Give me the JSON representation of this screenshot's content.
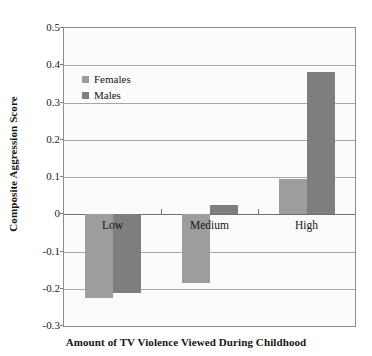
{
  "chart_data": {
    "type": "bar",
    "title": "",
    "xlabel": "Amount of TV Violence Viewed During Childhood",
    "ylabel": "Composite Aggression Score",
    "categories": [
      "Low",
      "Medium",
      "High"
    ],
    "series": [
      {
        "name": "Females",
        "color": "#9d9d9d",
        "values": [
          -0.225,
          -0.185,
          0.095
        ]
      },
      {
        "name": "Males",
        "color": "#7e7e7e",
        "values": [
          -0.212,
          0.025,
          0.383
        ]
      }
    ],
    "ylim": [
      -0.3,
      0.5
    ],
    "yticks": [
      0.5,
      0.4,
      0.3,
      0.2,
      0.1,
      0,
      -0.1,
      -0.2,
      -0.3
    ],
    "ytick_labels": [
      "0.5",
      "0.4",
      "0.3",
      "0.2",
      "0.1",
      "0",
      "-0.1",
      "-0.2",
      "-0.3"
    ],
    "grid": true,
    "legend_position": "top-left-inside",
    "legend_entries": [
      "Females",
      "Males"
    ]
  }
}
